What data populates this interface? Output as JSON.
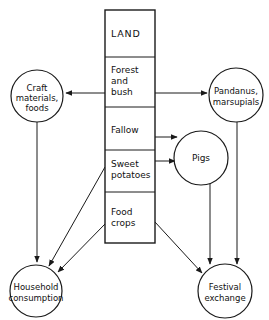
{
  "diagram": {
    "title": "LAND",
    "land_column": {
      "header": "LAND",
      "cells": [
        {
          "id": "forest-and-bush",
          "lines": [
            "Forest",
            "and",
            "bush"
          ]
        },
        {
          "id": "fallow",
          "lines": [
            "Fallow"
          ]
        },
        {
          "id": "sweet-potatoes",
          "lines": [
            "Sweet",
            "potatoes"
          ]
        },
        {
          "id": "food-crops",
          "lines": [
            "Food",
            "crops"
          ]
        }
      ]
    },
    "circles": [
      {
        "id": "craft-materials-foods",
        "lines": [
          "Craft",
          "materials,",
          "foods"
        ]
      },
      {
        "id": "pandanus-marsupials",
        "lines": [
          "Pandanus,",
          "marsupials"
        ]
      },
      {
        "id": "pigs",
        "lines": [
          "Pigs"
        ]
      },
      {
        "id": "household-consumption",
        "lines": [
          "Household",
          "consumption"
        ]
      },
      {
        "id": "festival-exchange",
        "lines": [
          "Festival",
          "exchange"
        ]
      }
    ],
    "edges": [
      {
        "id": "forest-to-craft",
        "from": "forest-and-bush",
        "to": "craft-materials-foods"
      },
      {
        "id": "forest-to-pandanus",
        "from": "forest-and-bush",
        "to": "pandanus-marsupials"
      },
      {
        "id": "fallow-to-pigs",
        "from": "fallow",
        "to": "pigs"
      },
      {
        "id": "sweet-potatoes-to-pigs",
        "from": "sweet-potatoes",
        "to": "pigs"
      },
      {
        "id": "craft-to-household",
        "from": "craft-materials-foods",
        "to": "household-consumption"
      },
      {
        "id": "sweet-potatoes-to-household",
        "from": "sweet-potatoes",
        "to": "household-consumption"
      },
      {
        "id": "food-crops-to-household",
        "from": "food-crops",
        "to": "household-consumption"
      },
      {
        "id": "food-crops-to-festival",
        "from": "food-crops",
        "to": "festival-exchange"
      },
      {
        "id": "pigs-to-festival",
        "from": "pigs",
        "to": "festival-exchange"
      },
      {
        "id": "pandanus-to-festival",
        "from": "pandanus-marsupials",
        "to": "festival-exchange"
      }
    ],
    "colors": {
      "stroke": "#1a1a1a",
      "text": "#111111",
      "background": "#ffffff"
    }
  }
}
